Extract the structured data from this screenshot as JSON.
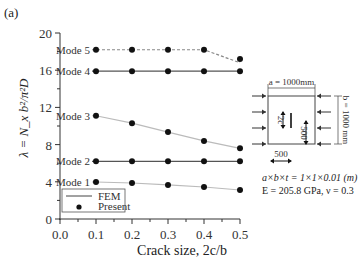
{
  "panel_label": "(a)",
  "chart_data": {
    "type": "line",
    "title": "",
    "xlabel": "Crack size, 2c/b",
    "ylabel": "λ = N_x b²/π²D",
    "xlim": [
      0.0,
      0.5
    ],
    "ylim": [
      0,
      20
    ],
    "x_ticks": [
      "0.0",
      "0.1",
      "0.2",
      "0.3",
      "0.4",
      "0.5"
    ],
    "y_ticks": [
      "0",
      "4",
      "8",
      "12",
      "16",
      "20"
    ],
    "grid": false,
    "legend": {
      "position": "lower left",
      "entries": [
        "FEM",
        "Present"
      ]
    },
    "x": [
      0.1,
      0.2,
      0.3,
      0.4,
      0.5
    ],
    "series": [
      {
        "name": "Mode 1",
        "values": [
          3.98,
          3.87,
          3.66,
          3.44,
          3.12
        ],
        "style": "solid-light"
      },
      {
        "name": "Mode 2",
        "values": [
          6.2,
          6.2,
          6.2,
          6.2,
          6.2
        ],
        "style": "solid"
      },
      {
        "name": "Mode 3",
        "values": [
          11.1,
          10.3,
          9.35,
          8.4,
          7.6
        ],
        "style": "solid-light"
      },
      {
        "name": "Mode 4",
        "values": [
          15.9,
          15.9,
          15.9,
          15.9,
          15.9
        ],
        "style": "solid"
      },
      {
        "name": "Mode 5",
        "values": [
          18.2,
          18.2,
          18.2,
          18.2,
          17.2
        ],
        "style": "dashed"
      }
    ]
  },
  "legend": {
    "fem": "FEM",
    "present": "Present"
  },
  "inset": {
    "dim_a": "a = 1000mm",
    "dim_b": "b = 1000 mm",
    "crack": "2c",
    "dim_500_v": "500",
    "dim_500_h": "500"
  },
  "params": {
    "line1": "a×b×t = 1×1×0.01 (m)",
    "line2": "E = 205.8 GPa, ν = 0.3"
  },
  "colors": {
    "axis": "#333333",
    "marker": "#111111",
    "line": "#555555",
    "light_line": "#bbbbbb"
  }
}
